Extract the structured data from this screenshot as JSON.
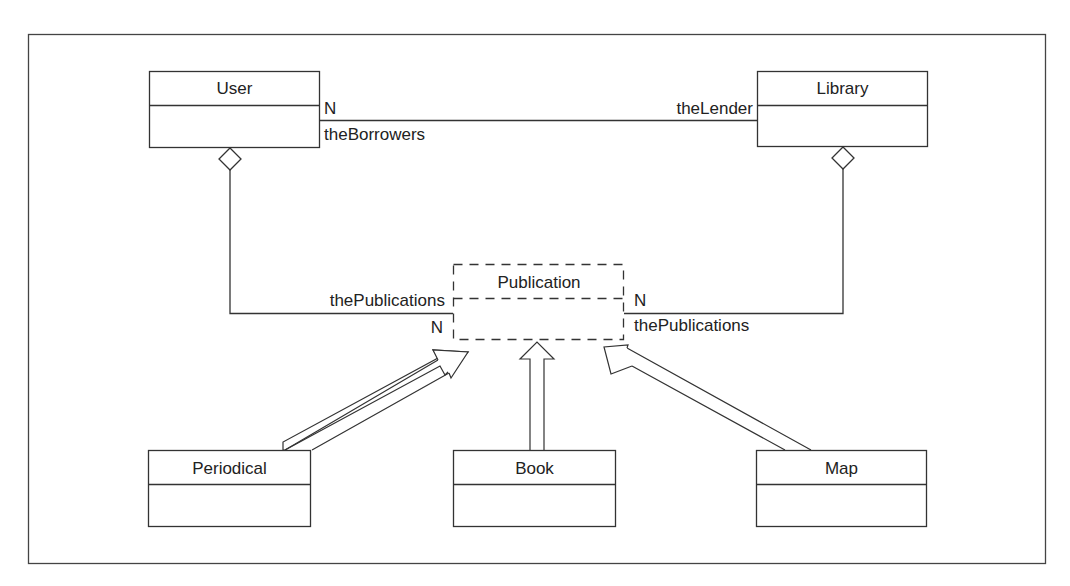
{
  "diagram": {
    "type": "UML class diagram",
    "classes": {
      "user": {
        "name": "User"
      },
      "library": {
        "name": "Library"
      },
      "publication": {
        "name": "Publication",
        "style": "dashed"
      },
      "periodical": {
        "name": "Periodical"
      },
      "book": {
        "name": "Book"
      },
      "map": {
        "name": "Map"
      }
    },
    "associations": {
      "user_library": {
        "user_mult": "N",
        "user_role": "theBorrowers",
        "library_role": "theLender"
      },
      "user_publication": {
        "role": "thePublications",
        "mult": "N"
      },
      "library_publication": {
        "mult": "N",
        "role": "thePublications"
      }
    },
    "generalizations": [
      "Periodical → Publication",
      "Book → Publication",
      "Map → Publication"
    ],
    "colors": {
      "stroke": "#333333",
      "background": "#ffffff"
    }
  }
}
